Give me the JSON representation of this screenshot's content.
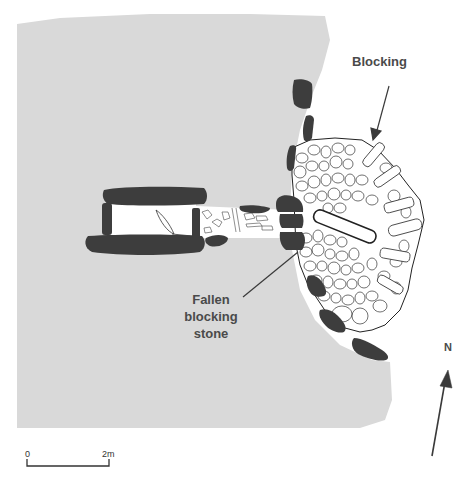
{
  "figure": {
    "type": "archaeological site plan",
    "colors": {
      "background": "#ffffff",
      "mound": "#d9d9d9",
      "orthostats": "#3d3d3d",
      "blocking_fill": "#ffffff",
      "blocking_outline": "#222222",
      "text": "#4a4a4a",
      "arrows": "#3a3a3a"
    }
  },
  "labels": {
    "blocking": "Blocking",
    "fallen_line1": "Fallen",
    "fallen_line2": "blocking",
    "fallen_line3": "stone",
    "north": "N"
  },
  "scale_bar": {
    "start_label": "0",
    "end_label": "2m"
  }
}
